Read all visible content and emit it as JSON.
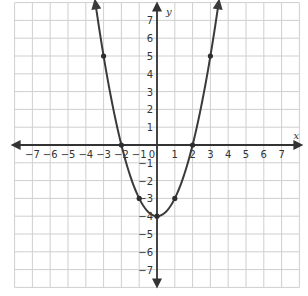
{
  "colors": {
    "grid": "#cfcfcf",
    "axis": "#333333",
    "curve": "#3a3a3a",
    "point": "#2e2e2e",
    "background": "#ffffff"
  },
  "chart_data": {
    "type": "line",
    "title": "",
    "function": "y = x^2 - 4",
    "xlabel": "x",
    "ylabel": "y",
    "xlim": [
      -8,
      8
    ],
    "ylim": [
      -8,
      8
    ],
    "grid": true,
    "x_ticks": [
      -7,
      -6,
      -5,
      -4,
      -3,
      -2,
      -1,
      0,
      1,
      2,
      3,
      4,
      5,
      6,
      7
    ],
    "y_ticks": [
      -7,
      -6,
      -5,
      -4,
      -3,
      -2,
      -1,
      1,
      2,
      3,
      4,
      5,
      6,
      7
    ],
    "x_tick_labels": [
      "−7",
      "−6",
      "−5",
      "−4",
      "−3",
      "−2",
      "−1",
      "0",
      "1",
      "2",
      "3",
      "4",
      "5",
      "6",
      "7"
    ],
    "y_tick_labels": [
      "−7",
      "−6",
      "−5",
      "−4",
      "−3",
      "−2",
      "−1",
      "1",
      "2",
      "3",
      "4",
      "5",
      "6",
      "7"
    ],
    "series": [
      {
        "name": "parabola",
        "marked_points": [
          {
            "x": -3,
            "y": 5
          },
          {
            "x": -2,
            "y": 0
          },
          {
            "x": -1,
            "y": -3
          },
          {
            "x": 0,
            "y": -4
          },
          {
            "x": 1,
            "y": -3
          },
          {
            "x": 2,
            "y": 0
          },
          {
            "x": 3,
            "y": 5
          }
        ],
        "curve_x_range": [
          -3.45,
          3.45
        ],
        "arrows_at_ends": true
      }
    ]
  },
  "layout": {
    "origin_px": [
      157,
      145
    ],
    "unit_px": 17.8
  }
}
